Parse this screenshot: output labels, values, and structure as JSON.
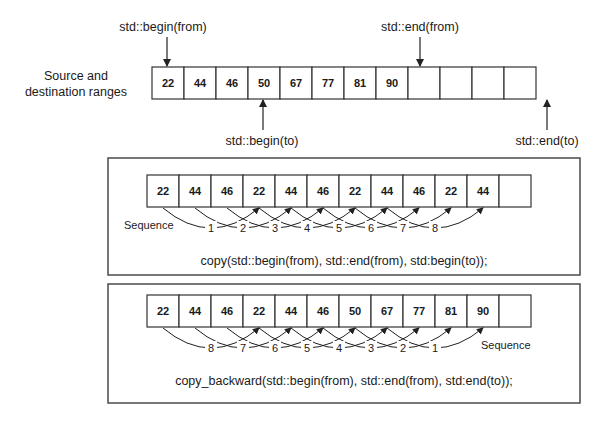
{
  "top": {
    "range_label_line1": "Source and",
    "range_label_line2": "destination ranges",
    "cells": [
      "22",
      "44",
      "46",
      "50",
      "67",
      "77",
      "81",
      "90",
      "",
      "",
      "",
      ""
    ],
    "pointers": {
      "begin_from": "std::begin(from)",
      "end_from": "std::end(from)",
      "begin_to": "std::begin(to)",
      "end_to": "std::end(to)"
    }
  },
  "copy_panel": {
    "cells": [
      "22",
      "44",
      "46",
      "22",
      "44",
      "46",
      "22",
      "44",
      "46",
      "22",
      "44",
      ""
    ],
    "sequence_label": "Sequence",
    "sequence_numbers": [
      "1",
      "2",
      "3",
      "4",
      "5",
      "6",
      "7",
      "8"
    ],
    "code": "copy(std::begin(from), std::end(from), std:begin(to));"
  },
  "copy_backward_panel": {
    "cells": [
      "22",
      "44",
      "46",
      "22",
      "44",
      "46",
      "50",
      "67",
      "77",
      "81",
      "90",
      ""
    ],
    "sequence_label": "Sequence",
    "sequence_numbers": [
      "8",
      "7",
      "6",
      "5",
      "4",
      "3",
      "2",
      "1"
    ],
    "code": "copy_backward(std::begin(from), std::end(from), std:end(to));"
  },
  "colors": {
    "stroke": "#333333",
    "panel_border": "#555555",
    "text": "#1a1a1a",
    "background": "#ffffff"
  }
}
